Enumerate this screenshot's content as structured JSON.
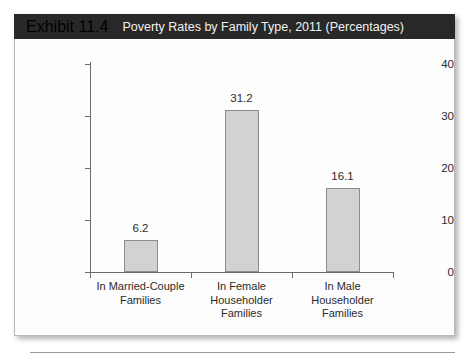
{
  "exhibit": {
    "number": "Exhibit 11.4",
    "title": "Poverty Rates by Family Type, 2011 (Percentages)"
  },
  "chart_data": {
    "type": "bar",
    "title": "Poverty Rates by Family Type, 2011 (Percentages)",
    "categories": [
      "In Married-Couple Families",
      "In Female Householder Families",
      "In Male Householder Families"
    ],
    "category_lines": [
      [
        "In Married-Couple",
        "Families"
      ],
      [
        "In Female",
        "Householder",
        "Families"
      ],
      [
        "In Male",
        "Householder",
        "Families"
      ]
    ],
    "values": [
      6.2,
      31.2,
      16.1
    ],
    "value_labels": [
      "6.2",
      "31.2",
      "16.1"
    ],
    "xlabel": "",
    "ylabel": "",
    "ylim": [
      0,
      40
    ],
    "yticks": [
      0,
      10,
      20,
      30,
      40
    ],
    "ytick_labels": [
      "0",
      "10",
      "20",
      "30",
      "40"
    ],
    "grid": false,
    "legend": false,
    "bar_color": "#d2d2d2",
    "bar_border_color": "#8c8c8c",
    "axis_color": "#6d6d6d",
    "header_color": "#282828",
    "background": "#fdfdfd"
  }
}
